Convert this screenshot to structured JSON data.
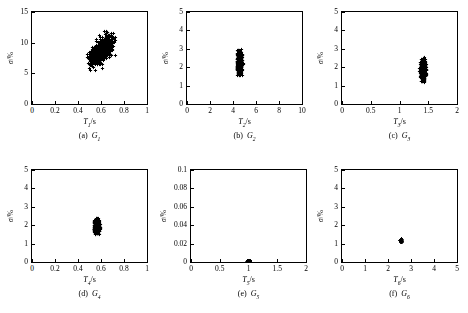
{
  "figure": {
    "background": "#ffffff",
    "marker_color": "#000000",
    "axis_color": "#000000",
    "rows": 2,
    "cols": 3
  },
  "chart_data": [
    {
      "type": "scatter",
      "id": "a",
      "caption_index": "(a)",
      "caption_name": "G",
      "caption_sub": "1",
      "xlabel_sym": "T",
      "xlabel_sub": "1",
      "xlabel_unit": "/s",
      "ylabel": "σ/%",
      "xlim": [
        0,
        1
      ],
      "ylim": [
        0,
        15
      ],
      "xticks": [
        0,
        0.2,
        0.4,
        0.6,
        0.8,
        1
      ],
      "xticklabels": [
        "0",
        "0.2",
        "0.4",
        "0.6",
        "0.8",
        "1"
      ],
      "yticks": [
        0,
        5,
        10,
        15
      ],
      "yticklabels": [
        "0",
        "5",
        "10",
        "15"
      ],
      "grid": false,
      "marker": "plus",
      "n_points": 700,
      "cluster": {
        "x_mean": 0.598,
        "x_sd": 0.049,
        "y_mean": 8.75,
        "y_sd": 1.15,
        "corr": 0.62
      },
      "x_range_observed": [
        0.48,
        0.76
      ],
      "y_range_observed": [
        5.3,
        12.0
      ]
    },
    {
      "type": "scatter",
      "id": "b",
      "caption_index": "(b)",
      "caption_name": "G",
      "caption_sub": "2",
      "xlabel_sym": "T",
      "xlabel_sub": "2",
      "xlabel_unit": "/s",
      "ylabel": "σ/%",
      "xlim": [
        0,
        10
      ],
      "ylim": [
        0,
        5
      ],
      "xticks": [
        0,
        2,
        4,
        6,
        8,
        10
      ],
      "xticklabels": [
        "0",
        "2",
        "4",
        "6",
        "8",
        "10"
      ],
      "yticks": [
        0,
        1,
        2,
        3,
        4,
        5
      ],
      "yticklabels": [
        "0",
        "1",
        "2",
        "3",
        "4",
        "5"
      ],
      "grid": false,
      "marker": "plus",
      "n_points": 700,
      "cluster": {
        "x_mean": 4.55,
        "x_sd": 0.1,
        "y_mean": 2.28,
        "y_sd": 0.3,
        "corr": 0.0
      },
      "x_range_observed": [
        4.3,
        4.85
      ],
      "y_range_observed": [
        1.55,
        3.02
      ]
    },
    {
      "type": "scatter",
      "id": "c",
      "caption_index": "(c)",
      "caption_name": "G",
      "caption_sub": "3",
      "xlabel_sym": "T",
      "xlabel_sub": "3",
      "xlabel_unit": "/s",
      "ylabel": "σ/%",
      "xlim": [
        0,
        2
      ],
      "ylim": [
        0,
        5
      ],
      "xticks": [
        0,
        0.5,
        1,
        1.5,
        2
      ],
      "xticklabels": [
        "0",
        "0.5",
        "1",
        "1.5",
        "2"
      ],
      "yticks": [
        0,
        1,
        2,
        3,
        4,
        5
      ],
      "yticklabels": [
        "0",
        "1",
        "2",
        "3",
        "4",
        "5"
      ],
      "grid": false,
      "marker": "plus",
      "n_points": 700,
      "cluster": {
        "x_mean": 1.405,
        "x_sd": 0.022,
        "y_mean": 1.86,
        "y_sd": 0.26,
        "corr": 0.0
      },
      "x_range_observed": [
        1.34,
        1.47
      ],
      "y_range_observed": [
        1.2,
        2.55
      ]
    },
    {
      "type": "scatter",
      "id": "d",
      "caption_index": "(d)",
      "caption_name": "G",
      "caption_sub": "4",
      "xlabel_sym": "T",
      "xlabel_sub": "4",
      "xlabel_unit": "/s",
      "ylabel": "σ/%",
      "xlim": [
        0,
        1
      ],
      "ylim": [
        0,
        5
      ],
      "xticks": [
        0,
        0.2,
        0.4,
        0.6,
        0.8,
        1
      ],
      "xticklabels": [
        "0",
        "0.2",
        "0.4",
        "0.6",
        "0.8",
        "1"
      ],
      "yticks": [
        0,
        1,
        2,
        3,
        4,
        5
      ],
      "yticklabels": [
        "0",
        "1",
        "2",
        "3",
        "4",
        "5"
      ],
      "grid": false,
      "marker": "plus",
      "n_points": 650,
      "cluster": {
        "x_mean": 0.562,
        "x_sd": 0.011,
        "y_mean": 1.93,
        "y_sd": 0.17,
        "corr": 0.0
      },
      "x_range_observed": [
        0.535,
        0.592
      ],
      "y_range_observed": [
        1.5,
        2.42
      ]
    },
    {
      "type": "scatter",
      "id": "e",
      "caption_index": "(e)",
      "caption_name": "G",
      "caption_sub": "5",
      "xlabel_sym": "T",
      "xlabel_sub": "5",
      "xlabel_unit": "/s",
      "ylabel": "σ/%",
      "xlim": [
        0,
        2
      ],
      "ylim": [
        0,
        0.1
      ],
      "xticks": [
        0,
        0.5,
        1,
        1.5,
        2
      ],
      "xticklabels": [
        "0",
        "0.5",
        "1",
        "1.5",
        "2"
      ],
      "yticks": [
        0,
        0.02,
        0.04,
        0.06,
        0.08,
        0.1
      ],
      "yticklabels": [
        "0",
        "0.02",
        "0.04",
        "0.06",
        "0.08",
        "0.1"
      ],
      "grid": false,
      "marker": "plus",
      "n_points": 250,
      "cluster": {
        "x_mean": 0.998,
        "x_sd": 0.012,
        "y_mean": 0.0009,
        "y_sd": 0.0007,
        "corr": 0.0
      },
      "x_range_observed": [
        0.96,
        1.04
      ],
      "y_range_observed": [
        0.0,
        0.003
      ]
    },
    {
      "type": "scatter",
      "id": "f",
      "caption_index": "(f)",
      "caption_name": "G",
      "caption_sub": "6",
      "xlabel_sym": "T",
      "xlabel_sub": "6",
      "xlabel_unit": "/s",
      "ylabel": "σ/%",
      "xlim": [
        0,
        5
      ],
      "ylim": [
        0,
        5
      ],
      "xticks": [
        0,
        1,
        2,
        3,
        4,
        5
      ],
      "xticklabels": [
        "0",
        "1",
        "2",
        "3",
        "4",
        "5"
      ],
      "yticks": [
        0,
        1,
        2,
        3,
        4,
        5
      ],
      "yticklabels": [
        "0",
        "1",
        "2",
        "3",
        "4",
        "5"
      ],
      "grid": false,
      "marker": "plus",
      "n_points": 120,
      "cluster": {
        "x_mean": 2.55,
        "x_sd": 0.022,
        "y_mean": 1.18,
        "y_sd": 0.045,
        "corr": 0.0
      },
      "x_range_observed": [
        2.49,
        2.61
      ],
      "y_range_observed": [
        1.07,
        1.3
      ]
    }
  ]
}
